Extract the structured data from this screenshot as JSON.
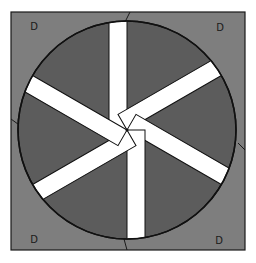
{
  "diagram": {
    "type": "radial-spoke-wheel-in-square",
    "frame": {
      "x": 11,
      "y": 12,
      "width": 234,
      "height": 238,
      "fill": "#7e7e7e",
      "stroke": "#1a1a1a"
    },
    "circle": {
      "cx": 127,
      "cy": 130,
      "r": 109,
      "fill": "#5c5c5c",
      "stroke": "#111111"
    },
    "spokes": {
      "count": 6,
      "fill": "#ffffff",
      "stroke": "#111111",
      "width": 18,
      "angles_deg": [
        270,
        330,
        30,
        90,
        150,
        210
      ],
      "offset_px": 9
    },
    "corner_labels": [
      {
        "position": "top-left",
        "text": "D",
        "x": 34,
        "y": 30
      },
      {
        "position": "top-right",
        "text": "D",
        "x": 220,
        "y": 31
      },
      {
        "position": "bottom-left",
        "text": "D",
        "x": 34,
        "y": 243
      },
      {
        "position": "bottom-right",
        "text": "D",
        "x": 219,
        "y": 244
      }
    ],
    "edge_ticks": [
      {
        "position": "top",
        "x1": 130,
        "y1": 12,
        "x2": 125,
        "y2": 22
      },
      {
        "position": "left",
        "x1": 11,
        "y1": 119,
        "x2": 22,
        "y2": 127
      },
      {
        "position": "right",
        "x1": 245,
        "y1": 150,
        "x2": 238,
        "y2": 143
      },
      {
        "position": "bottom",
        "x1": 124,
        "y1": 239,
        "x2": 127,
        "y2": 250
      }
    ]
  }
}
